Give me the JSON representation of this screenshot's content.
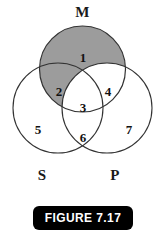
{
  "figure": {
    "caption": "FIGURE 7.17",
    "caption_bg": "#000000",
    "caption_fg": "#ffffff"
  },
  "diagram": {
    "type": "venn",
    "circle_count": 3,
    "stroke_color": "#222222",
    "fill_color": "#ffffff",
    "shade_color": "#9c9c9c",
    "background": "#ffffff",
    "set_labels": [
      {
        "name": "M",
        "text": "M",
        "position": "top"
      },
      {
        "name": "S",
        "text": "S",
        "position": "bottom-left"
      },
      {
        "name": "P",
        "text": "P",
        "position": "bottom-right"
      }
    ],
    "regions": [
      {
        "id": 1,
        "label": "1",
        "sets": "M only",
        "shaded": true
      },
      {
        "id": 2,
        "label": "2",
        "sets": "M and S only",
        "shaded": true
      },
      {
        "id": 3,
        "label": "3",
        "sets": "M and S and P",
        "shaded": false
      },
      {
        "id": 4,
        "label": "4",
        "sets": "M and P only",
        "shaded": false
      },
      {
        "id": 5,
        "label": "5",
        "sets": "S only",
        "shaded": false
      },
      {
        "id": 6,
        "label": "6",
        "sets": "S and P only",
        "shaded": false
      },
      {
        "id": 7,
        "label": "7",
        "sets": "P only",
        "shaded": false
      }
    ]
  }
}
